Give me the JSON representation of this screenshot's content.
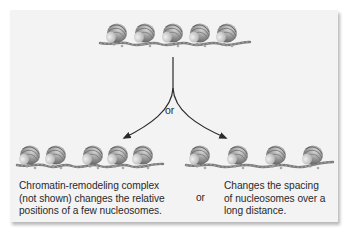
{
  "diagram": {
    "top_row": {
      "description": "Regularly spaced nucleosomes on DNA",
      "nucleosome_count": 5,
      "nucleosome_x": [
        117,
        145,
        173,
        200,
        227
      ],
      "y": 35,
      "dna_span": [
        100,
        250
      ]
    },
    "branch_label": "or",
    "left_outcome": {
      "nucleosome_count": 5,
      "nucleosome_x": [
        30,
        56,
        93,
        118,
        143
      ],
      "y": 157,
      "dna_span": [
        17,
        163
      ],
      "caption": "Chromatin-remodeling complex\n(not shown) changes the relative\npositions of a few nucleosomes."
    },
    "middle_connector": "or",
    "right_outcome": {
      "nucleosome_count": 4,
      "nucleosome_x": [
        200,
        238,
        276,
        313
      ],
      "y": 157,
      "dna_span": [
        186,
        333
      ],
      "caption": "Changes the spacing\nof nucleosomes over a\nlong distance."
    },
    "colors": {
      "panel_bg": "#f3f3f3",
      "text": "#2a2a2a",
      "arrow": "#2a2a2a",
      "nucleosome_dark": "#6e6e6e",
      "nucleosome_light": "#c9c9c9",
      "dna": "#7a7a7a"
    }
  }
}
